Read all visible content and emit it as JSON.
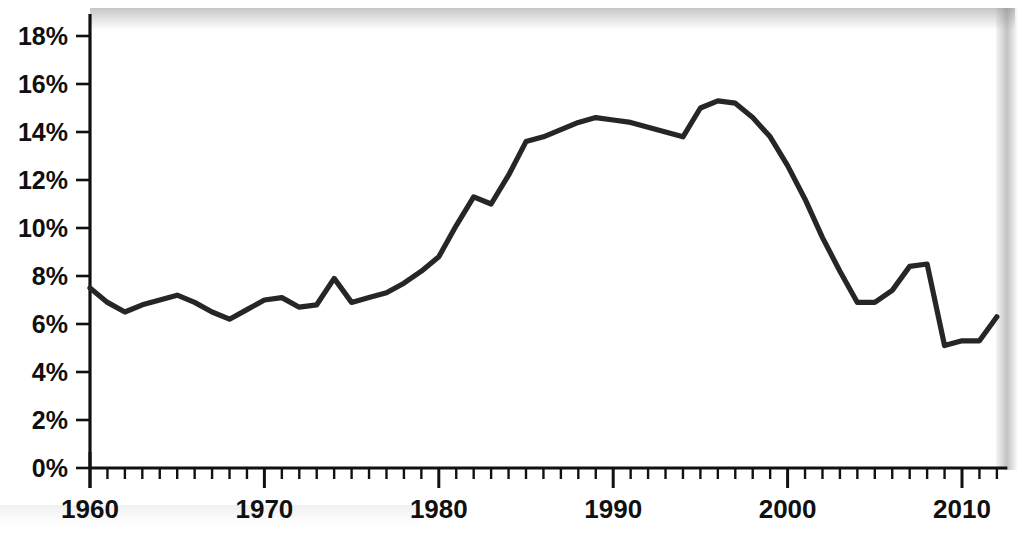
{
  "chart_data": {
    "type": "line",
    "title": "",
    "xlabel": "",
    "ylabel": "",
    "xlim": [
      1960,
      2012
    ],
    "ylim": [
      0,
      19
    ],
    "grid": false,
    "legend": null,
    "y_tick_labels": [
      "0%",
      "2%",
      "4%",
      "6%",
      "8%",
      "10%",
      "12%",
      "14%",
      "16%",
      "18%"
    ],
    "y_tick_values": [
      0,
      2,
      4,
      6,
      8,
      10,
      12,
      14,
      16,
      18
    ],
    "x_tick_labels": [
      "1960",
      "1970",
      "1980",
      "1990",
      "2000",
      "2010"
    ],
    "x_tick_values": [
      1960,
      1970,
      1980,
      1990,
      2000,
      2010
    ],
    "x_minor_tick_step": 1,
    "series": [
      {
        "name": "series-1",
        "color": "#262626",
        "x": [
          1960,
          1961,
          1962,
          1963,
          1964,
          1965,
          1966,
          1967,
          1968,
          1969,
          1970,
          1971,
          1972,
          1973,
          1974,
          1975,
          1976,
          1977,
          1978,
          1979,
          1980,
          1981,
          1982,
          1983,
          1984,
          1985,
          1986,
          1987,
          1988,
          1989,
          1990,
          1991,
          1992,
          1993,
          1994,
          1995,
          1996,
          1997,
          1998,
          1999,
          2000,
          2001,
          2002,
          2003,
          2004,
          2005,
          2006,
          2007,
          2008,
          2009,
          2010,
          2011,
          2012
        ],
        "values": [
          7.5,
          6.9,
          6.5,
          6.8,
          7.0,
          7.2,
          6.9,
          6.5,
          6.2,
          6.6,
          7.0,
          7.1,
          6.7,
          6.8,
          7.9,
          6.9,
          7.1,
          7.3,
          7.7,
          8.2,
          8.8,
          10.1,
          11.3,
          11.0,
          12.2,
          13.6,
          13.8,
          14.1,
          14.4,
          14.6,
          14.5,
          14.4,
          14.2,
          14.0,
          13.8,
          15.0,
          15.3,
          15.2,
          14.6,
          13.8,
          12.6,
          11.2,
          9.6,
          8.2,
          6.9,
          6.9,
          7.4,
          8.4,
          8.5,
          5.1,
          5.3,
          5.3,
          6.3
        ]
      }
    ]
  },
  "axes": {
    "y_axis_name": "percent-axis",
    "x_axis_name": "year-axis"
  }
}
